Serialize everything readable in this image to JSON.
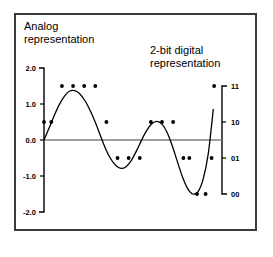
{
  "figure": {
    "left_annotation": "Analog\nrepresentation",
    "right_annotation": "2-bit digital\nrepresentation",
    "frame_color": "#3a3a3a",
    "curve_color": "#000000",
    "zero_line_color": "#808080",
    "dot_color": "#000000"
  },
  "chart_data": {
    "type": "line",
    "title": "",
    "subtitle": "",
    "xlabel": "",
    "ylabel": "Analog representation",
    "y2label": "2-bit digital representation",
    "grid": false,
    "legend": "none",
    "ylim": [
      -2.0,
      2.0
    ],
    "y_ticks": [
      "2.0",
      "1.0",
      "0.0",
      "-1.0",
      "-2.0"
    ],
    "y_tick_values": [
      2.0,
      1.0,
      0.0,
      -1.0,
      -2.0
    ],
    "y2_ticks": [
      "11",
      "10",
      "01",
      "00"
    ],
    "y2_tick_values": [
      1.5,
      0.5,
      -0.5,
      -1.5
    ],
    "xlim": [
      0,
      20
    ],
    "series": [
      {
        "name": "analog signal",
        "kind": "curve",
        "x": [
          0.0,
          0.6,
          1.2,
          1.8,
          2.4,
          3.0,
          3.6,
          4.2,
          4.8,
          5.4,
          6.0,
          6.6,
          7.2,
          7.8,
          8.4,
          9.0,
          9.6,
          10.2,
          10.8,
          11.4,
          12.0,
          12.6,
          13.2,
          13.8,
          14.4,
          15.0,
          15.6,
          16.2,
          16.8,
          17.4,
          18.0,
          18.6,
          19.2,
          19.8
        ],
        "y": [
          0.0,
          0.33,
          0.68,
          0.99,
          1.22,
          1.36,
          1.37,
          1.28,
          1.09,
          0.82,
          0.49,
          0.12,
          -0.24,
          -0.52,
          -0.71,
          -0.79,
          -0.74,
          -0.57,
          -0.31,
          -0.01,
          0.26,
          0.45,
          0.52,
          0.44,
          0.21,
          -0.16,
          -0.6,
          -1.03,
          -1.35,
          -1.5,
          -1.44,
          -1.1,
          -0.4,
          0.85
        ]
      },
      {
        "name": "zero reference line",
        "kind": "hline",
        "y": 0.0
      },
      {
        "name": "2-bit samples",
        "kind": "scatter",
        "points": [
          {
            "x": 0.0,
            "y": 0.5,
            "code": "10"
          },
          {
            "x": 0.85,
            "y": 0.5,
            "code": "10"
          },
          {
            "x": 2.1,
            "y": 1.5,
            "code": "11"
          },
          {
            "x": 3.4,
            "y": 1.5,
            "code": "11"
          },
          {
            "x": 4.7,
            "y": 1.5,
            "code": "11"
          },
          {
            "x": 6.0,
            "y": 1.5,
            "code": "11"
          },
          {
            "x": 7.3,
            "y": 0.5,
            "code": "10"
          },
          {
            "x": 8.6,
            "y": -0.5,
            "code": "01"
          },
          {
            "x": 9.9,
            "y": -0.5,
            "code": "01"
          },
          {
            "x": 11.2,
            "y": -0.5,
            "code": "01"
          },
          {
            "x": 12.5,
            "y": 0.5,
            "code": "10"
          },
          {
            "x": 13.8,
            "y": 0.5,
            "code": "10"
          },
          {
            "x": 15.1,
            "y": 0.5,
            "code": "10"
          },
          {
            "x": 16.3,
            "y": -0.5,
            "code": "01"
          },
          {
            "x": 17.0,
            "y": -0.5,
            "code": "01"
          },
          {
            "x": 17.9,
            "y": -1.5,
            "code": "00"
          },
          {
            "x": 18.9,
            "y": -1.5,
            "code": "00"
          },
          {
            "x": 19.6,
            "y": -0.5,
            "code": "01"
          },
          {
            "x": 19.9,
            "y": 1.5,
            "code": "11"
          }
        ]
      }
    ]
  }
}
